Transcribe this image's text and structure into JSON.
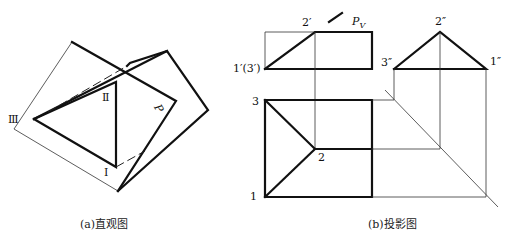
{
  "figure_a": {
    "caption": "(a)直观图",
    "labels": {
      "I": "Ⅰ",
      "II": "Ⅱ",
      "III": "Ⅲ",
      "P": "P"
    }
  },
  "figure_b": {
    "caption": "(b)投影图",
    "front_view": {
      "label_2": "2′",
      "label_13": "1′(3′)",
      "plane": "P",
      "plane_sub": "V"
    },
    "side_view": {
      "label_2": "2″",
      "label_3": "3″",
      "label_1": "1″"
    },
    "top_view": {
      "label_1": "1",
      "label_2": "2",
      "label_3": "3"
    }
  }
}
